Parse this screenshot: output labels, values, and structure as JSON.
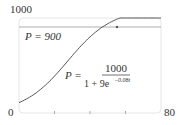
{
  "chart_data": {
    "type": "line",
    "title": "",
    "xlabel": "",
    "ylabel": "",
    "xlim": [
      0,
      80
    ],
    "ylim": [
      0,
      1000
    ],
    "x_tick_labels": [
      "0",
      "80"
    ],
    "y_tick_labels": [
      "1000"
    ],
    "x_minor_ticks": [
      20,
      40,
      60
    ],
    "grid": false,
    "series": [
      {
        "name": "P = 1000/(1 + 9e^(-0.08t))",
        "x": [
          0,
          10,
          20,
          30,
          40,
          50,
          60,
          70,
          80
        ],
        "values": [
          100,
          198,
          355,
          550,
          731,
          858,
          933,
          970,
          987
        ]
      }
    ],
    "reference_lines": [
      {
        "name": "P = 900",
        "y": 900
      }
    ],
    "annotations": {
      "line_label": "P = 900",
      "equation_lhs": "P =",
      "equation_numerator": "1000",
      "equation_denominator_base": "1 + 9e",
      "equation_exponent": "−0.08t"
    }
  }
}
